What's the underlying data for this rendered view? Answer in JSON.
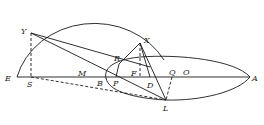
{
  "diagram": {
    "type": "geometric construction",
    "points": {
      "E": {
        "label": "E",
        "x": 17,
        "y": 77
      },
      "S": {
        "label": "S",
        "x": 31,
        "y": 77
      },
      "Y": {
        "label": "Y",
        "x": 31,
        "y": 33
      },
      "M": {
        "label": "M",
        "x": 80,
        "y": 77
      },
      "B": {
        "label": "B",
        "x": 106,
        "y": 77
      },
      "P": {
        "label": "P",
        "x": 116,
        "y": 77
      },
      "R": {
        "label": "R",
        "x": 119,
        "y": 64
      },
      "F": {
        "label": "F",
        "x": 140,
        "y": 77
      },
      "X": {
        "label": "X",
        "x": 140,
        "y": 43
      },
      "D": {
        "label": "D",
        "x": 150,
        "y": 77
      },
      "Q": {
        "label": "Q",
        "x": 172,
        "y": 77
      },
      "O": {
        "label": "O",
        "x": 185,
        "y": 77
      },
      "L": {
        "label": "L",
        "x": 166,
        "y": 100
      },
      "A": {
        "label": "A",
        "x": 250,
        "y": 77
      }
    },
    "labels": [
      "Y",
      "R",
      "X",
      "E",
      "S",
      "M",
      "B",
      "P",
      "F",
      "D",
      "Q",
      "O",
      "A",
      "L"
    ]
  }
}
